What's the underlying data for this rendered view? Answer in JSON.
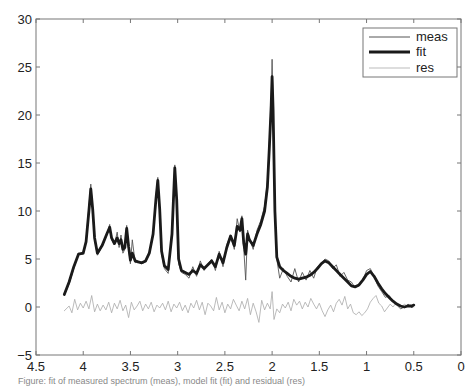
{
  "chart_data": {
    "type": "line",
    "title": "",
    "xlabel": "",
    "ylabel": "",
    "xlim": [
      4.5,
      0
    ],
    "ylim": [
      -5,
      30
    ],
    "x_reversed": true,
    "grid": false,
    "legend_position": "upper right",
    "xticks": [
      "4.5",
      "4",
      "3.5",
      "3",
      "2.5",
      "2",
      "1.5",
      "1",
      "0.5",
      "0"
    ],
    "yticks": [
      "30",
      "25",
      "20",
      "15",
      "10",
      "5",
      "0",
      "−5"
    ],
    "legend": [
      "meas",
      "fit",
      "res"
    ],
    "series": [
      {
        "name": "meas",
        "style": "thin dark gray line",
        "color": "#555555",
        "x": [
          4.2,
          4.15,
          4.1,
          4.05,
          4.0,
          3.97,
          3.94,
          3.92,
          3.9,
          3.88,
          3.85,
          3.8,
          3.75,
          3.72,
          3.7,
          3.67,
          3.64,
          3.62,
          3.6,
          3.58,
          3.56,
          3.54,
          3.52,
          3.5,
          3.48,
          3.45,
          3.42,
          3.38,
          3.34,
          3.3,
          3.26,
          3.23,
          3.21,
          3.19,
          3.17,
          3.14,
          3.1,
          3.06,
          3.03,
          3.01,
          2.99,
          2.96,
          2.92,
          2.88,
          2.84,
          2.8,
          2.76,
          2.72,
          2.68,
          2.64,
          2.6,
          2.56,
          2.52,
          2.48,
          2.44,
          2.4,
          2.37,
          2.34,
          2.32,
          2.3,
          2.28,
          2.26,
          2.24,
          2.2,
          2.16,
          2.12,
          2.08,
          2.05,
          2.03,
          2.01,
          2.0,
          1.99,
          1.97,
          1.95,
          1.92,
          1.88,
          1.84,
          1.8,
          1.76,
          1.72,
          1.68,
          1.64,
          1.6,
          1.56,
          1.52,
          1.48,
          1.44,
          1.4,
          1.36,
          1.32,
          1.28,
          1.24,
          1.2,
          1.16,
          1.12,
          1.08,
          1.04,
          1.0,
          0.96,
          0.92,
          0.88,
          0.84,
          0.8,
          0.76,
          0.72,
          0.68,
          0.64,
          0.6,
          0.56,
          0.52,
          0.5
        ],
        "y": [
          1.2,
          2.4,
          4.0,
          5.6,
          5.5,
          7.0,
          10.5,
          12.8,
          10.0,
          7.0,
          5.4,
          6.3,
          7.5,
          8.6,
          7.0,
          6.5,
          7.8,
          6.2,
          7.5,
          5.6,
          6.0,
          8.5,
          6.0,
          4.5,
          7.0,
          4.6,
          4.8,
          4.5,
          4.7,
          5.5,
          7.5,
          11.5,
          13.5,
          10.0,
          5.5,
          4.0,
          3.5,
          8.0,
          14.8,
          11.0,
          4.5,
          3.6,
          3.4,
          3.0,
          4.2,
          3.2,
          4.8,
          3.8,
          4.5,
          5.0,
          3.8,
          5.8,
          4.2,
          6.5,
          7.5,
          6.0,
          9.2,
          7.8,
          9.5,
          6.0,
          2.8,
          8.0,
          7.2,
          6.0,
          8.0,
          9.0,
          10.5,
          13.0,
          17.0,
          21.5,
          25.8,
          21.0,
          10.0,
          5.0,
          3.0,
          4.0,
          3.2,
          2.6,
          4.0,
          2.6,
          3.6,
          2.8,
          3.8,
          3.0,
          4.2,
          4.5,
          5.0,
          4.8,
          4.0,
          4.4,
          3.2,
          3.6,
          2.8,
          2.6,
          2.0,
          2.2,
          2.8,
          3.8,
          4.0,
          3.2,
          2.2,
          1.6,
          1.0,
          1.2,
          0.6,
          0.2,
          -0.2,
          0.0,
          0.3,
          -0.1,
          0.2
        ]
      },
      {
        "name": "fit",
        "style": "thick black line",
        "color": "#1a1a1a",
        "x": [
          4.2,
          4.15,
          4.1,
          4.05,
          4.0,
          3.97,
          3.94,
          3.92,
          3.9,
          3.88,
          3.85,
          3.8,
          3.75,
          3.72,
          3.7,
          3.67,
          3.64,
          3.62,
          3.6,
          3.58,
          3.56,
          3.54,
          3.52,
          3.5,
          3.48,
          3.45,
          3.42,
          3.38,
          3.34,
          3.3,
          3.26,
          3.23,
          3.21,
          3.19,
          3.17,
          3.14,
          3.1,
          3.06,
          3.03,
          3.01,
          2.99,
          2.96,
          2.92,
          2.88,
          2.84,
          2.8,
          2.76,
          2.72,
          2.68,
          2.64,
          2.6,
          2.56,
          2.52,
          2.48,
          2.44,
          2.4,
          2.37,
          2.34,
          2.32,
          2.3,
          2.28,
          2.26,
          2.24,
          2.2,
          2.16,
          2.12,
          2.08,
          2.05,
          2.03,
          2.01,
          2.0,
          1.99,
          1.97,
          1.95,
          1.92,
          1.88,
          1.84,
          1.8,
          1.76,
          1.72,
          1.68,
          1.64,
          1.6,
          1.56,
          1.52,
          1.48,
          1.44,
          1.4,
          1.36,
          1.32,
          1.28,
          1.24,
          1.2,
          1.16,
          1.12,
          1.08,
          1.04,
          1.0,
          0.96,
          0.92,
          0.88,
          0.84,
          0.8,
          0.76,
          0.72,
          0.68,
          0.64,
          0.6,
          0.56,
          0.52,
          0.5
        ],
        "y": [
          1.3,
          2.6,
          4.2,
          5.5,
          5.6,
          6.8,
          10.0,
          12.3,
          10.2,
          7.2,
          5.6,
          6.4,
          7.6,
          8.3,
          7.2,
          6.6,
          7.2,
          6.6,
          7.0,
          6.0,
          6.2,
          8.2,
          6.3,
          4.9,
          5.6,
          4.8,
          4.7,
          4.6,
          4.8,
          5.6,
          7.6,
          11.2,
          13.2,
          10.2,
          5.8,
          4.3,
          3.9,
          7.6,
          14.5,
          11.2,
          5.0,
          3.8,
          3.6,
          3.4,
          3.8,
          3.5,
          4.4,
          4.0,
          4.4,
          4.8,
          4.2,
          5.5,
          4.6,
          6.2,
          7.4,
          6.4,
          8.4,
          8.0,
          9.2,
          6.6,
          5.5,
          7.6,
          7.0,
          6.4,
          7.6,
          8.6,
          10.0,
          12.5,
          16.5,
          21.0,
          24.0,
          20.5,
          10.0,
          5.2,
          4.2,
          3.8,
          3.5,
          3.2,
          3.0,
          2.9,
          3.0,
          3.1,
          3.3,
          3.6,
          4.0,
          4.5,
          4.8,
          4.6,
          4.2,
          3.8,
          3.4,
          3.0,
          2.6,
          2.2,
          2.1,
          2.3,
          2.8,
          3.4,
          3.7,
          3.2,
          2.5,
          1.9,
          1.4,
          1.0,
          0.6,
          0.3,
          0.1,
          0.0,
          0.1,
          0.1,
          0.2
        ]
      },
      {
        "name": "res",
        "style": "thin light gray line",
        "color": "#aaaaaa",
        "x": [
          4.2,
          4.15,
          4.12,
          4.09,
          4.06,
          4.03,
          4.0,
          3.97,
          3.94,
          3.91,
          3.88,
          3.85,
          3.82,
          3.79,
          3.76,
          3.73,
          3.7,
          3.67,
          3.64,
          3.61,
          3.58,
          3.55,
          3.52,
          3.49,
          3.46,
          3.43,
          3.4,
          3.37,
          3.34,
          3.31,
          3.28,
          3.25,
          3.22,
          3.19,
          3.16,
          3.13,
          3.1,
          3.07,
          3.04,
          3.01,
          2.98,
          2.95,
          2.92,
          2.89,
          2.86,
          2.83,
          2.8,
          2.77,
          2.74,
          2.71,
          2.68,
          2.65,
          2.62,
          2.59,
          2.56,
          2.53,
          2.5,
          2.47,
          2.44,
          2.41,
          2.38,
          2.35,
          2.32,
          2.29,
          2.26,
          2.23,
          2.2,
          2.17,
          2.14,
          2.11,
          2.08,
          2.05,
          2.02,
          2.0,
          1.98,
          1.95,
          1.92,
          1.89,
          1.86,
          1.83,
          1.8,
          1.77,
          1.74,
          1.71,
          1.68,
          1.65,
          1.62,
          1.59,
          1.56,
          1.53,
          1.5,
          1.47,
          1.44,
          1.41,
          1.38,
          1.35,
          1.32,
          1.29,
          1.26,
          1.23,
          1.2,
          1.17,
          1.14,
          1.11,
          1.08,
          1.05,
          1.02,
          0.99,
          0.96,
          0.93,
          0.9,
          0.87,
          0.84,
          0.81,
          0.78,
          0.75,
          0.72,
          0.69,
          0.66,
          0.63,
          0.6,
          0.57,
          0.54,
          0.5
        ],
        "y": [
          -0.4,
          0.1,
          -0.6,
          0.8,
          -0.3,
          0.4,
          -0.1,
          0.6,
          -0.2,
          1.2,
          -0.5,
          0.3,
          -0.4,
          0.2,
          -0.3,
          0.5,
          -0.6,
          0.4,
          -0.2,
          0.7,
          -0.4,
          0.2,
          -1.1,
          0.5,
          -0.3,
          0.1,
          0.6,
          -0.4,
          0.3,
          -0.2,
          0.5,
          -0.5,
          0.2,
          -0.1,
          0.4,
          -0.3,
          0.6,
          -0.5,
          0.3,
          -0.1,
          0.5,
          -0.4,
          0.2,
          -0.6,
          0.4,
          -0.1,
          0.7,
          -0.3,
          0.5,
          -0.8,
          0.4,
          0.1,
          -0.4,
          1.0,
          -0.3,
          0.5,
          -0.6,
          0.3,
          -0.2,
          0.8,
          0.2,
          -0.4,
          0.6,
          -0.2,
          0.9,
          -0.8,
          0.4,
          -0.5,
          -1.6,
          0.7,
          -0.3,
          0.4,
          -0.2,
          1.6,
          -1.3,
          -0.2,
          -0.6,
          0.3,
          -0.1,
          0.5,
          -0.4,
          0.8,
          0.2,
          0.6,
          -0.2,
          0.5,
          0.0,
          0.9,
          0.3,
          -0.2,
          0.4,
          -0.4,
          -1.0,
          -0.3,
          0.2,
          -0.5,
          0.4,
          0.8,
          0.2,
          1.1,
          -0.2,
          0.3,
          -0.6,
          -0.8,
          -0.5,
          -0.9,
          -0.6,
          -0.2,
          0.5,
          0.9,
          1.2,
          0.4,
          0.1,
          -0.5,
          -0.1,
          0.3,
          0.0,
          0.4,
          0.2,
          -0.1,
          0.3,
          0.1,
          0.2,
          0.0
        ]
      }
    ]
  },
  "figure": {
    "caption": "Figure: fit of measured spectrum (meas), model fit (fit) and residual (res)"
  }
}
